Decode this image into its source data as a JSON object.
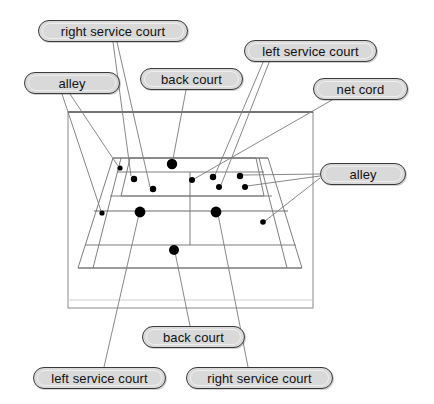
{
  "figure": {
    "type": "tennis-court-perspective-diagram",
    "background_color": "#ffffff",
    "line_color": "#6b6b6b",
    "point_color": "#000000",
    "label_fill": "#d9d9d9",
    "label_border": "#3a3a3a"
  },
  "labels": [
    {
      "id": "right-service-court-top",
      "text": "right service court",
      "x": 38,
      "y": 20,
      "width": 150
    },
    {
      "id": "left-service-court-top",
      "text": "left service court",
      "x": 244,
      "y": 40,
      "width": 133
    },
    {
      "id": "alley-left",
      "text": "alley",
      "x": 24,
      "y": 72,
      "width": 96
    },
    {
      "id": "back-court-top",
      "text": "back court",
      "x": 140,
      "y": 68,
      "width": 103
    },
    {
      "id": "net-cord",
      "text": "net cord",
      "x": 313,
      "y": 78,
      "width": 95
    },
    {
      "id": "alley-right",
      "text": "alley",
      "x": 320,
      "y": 163,
      "width": 86
    },
    {
      "id": "back-court-bottom",
      "text": "back court",
      "x": 142,
      "y": 326,
      "width": 103
    },
    {
      "id": "left-service-court-bottom",
      "text": "left service court",
      "x": 33,
      "y": 367,
      "width": 133
    },
    {
      "id": "right-service-court-bottom",
      "text": "right service court",
      "x": 186,
      "y": 367,
      "width": 147
    }
  ],
  "court": {
    "frame": {
      "x1": 68,
      "y1": 112,
      "x2": 313,
      "y2": 308
    },
    "far_baseline": {
      "x1": 113,
      "y1": 158,
      "x2": 268,
      "y2": 158
    },
    "near_baseline": {
      "x1": 78,
      "y1": 268,
      "x2": 302,
      "y2": 268
    },
    "net_line": {
      "x1": 94,
      "y1": 211,
      "x2": 288,
      "y2": 211
    },
    "far_service_line": {
      "x1": 107,
      "y1": 172,
      "x2": 275,
      "y2": 172
    },
    "near_service_line": {
      "x1": 100,
      "y1": 196,
      "x2": 282,
      "y2": 196
    },
    "center_service_line": {
      "x1": 190,
      "y1": 172,
      "x2": 190,
      "y2": 232
    }
  },
  "chart_data": {
    "type": "scatter",
    "xlabel": "",
    "ylabel": "",
    "point_color": "#000000",
    "points": [
      {
        "id": "p1",
        "x": 120,
        "y": 168,
        "r": 2.6,
        "region": "far alley"
      },
      {
        "id": "p2",
        "x": 134,
        "y": 179,
        "r": 3.2,
        "region": "far right service court"
      },
      {
        "id": "p3",
        "x": 153,
        "y": 189,
        "r": 3.2,
        "region": "far right service court"
      },
      {
        "id": "p4",
        "x": 172,
        "y": 164,
        "r": 5.2,
        "region": "far back court"
      },
      {
        "id": "p5",
        "x": 192,
        "y": 180,
        "r": 3.0,
        "region": "net cord"
      },
      {
        "id": "p6",
        "x": 213,
        "y": 177,
        "r": 3.2,
        "region": "far left service court"
      },
      {
        "id": "p7",
        "x": 219,
        "y": 187,
        "r": 3.0,
        "region": "far left service court"
      },
      {
        "id": "p8",
        "x": 240,
        "y": 176,
        "r": 3.2,
        "region": "far left alley"
      },
      {
        "id": "p9",
        "x": 245,
        "y": 187,
        "r": 3.0,
        "region": "far left alley"
      },
      {
        "id": "p10",
        "x": 102,
        "y": 213,
        "r": 2.6,
        "region": "near left alley"
      },
      {
        "id": "p11",
        "x": 140,
        "y": 212,
        "r": 5.4,
        "region": "near left service court"
      },
      {
        "id": "p12",
        "x": 216,
        "y": 212,
        "r": 5.4,
        "region": "near right service court"
      },
      {
        "id": "p13",
        "x": 263,
        "y": 222,
        "r": 2.8,
        "region": "near right alley"
      },
      {
        "id": "p14",
        "x": 174,
        "y": 250,
        "r": 5.0,
        "region": "near back court"
      }
    ]
  },
  "leaders": [
    {
      "from_label": "right-service-court-top",
      "points": "113,42 131,176"
    },
    {
      "from_label": "right-service-court-top",
      "points": "117,42 150,187"
    },
    {
      "from_label": "alley-left",
      "points": "70,94 118,166"
    },
    {
      "from_label": "alley-left",
      "points": "62,94 101,211"
    },
    {
      "from_label": "back-court-top",
      "points": "186,90 173,159"
    },
    {
      "from_label": "left-service-court-top",
      "points": "264,60 215,175"
    },
    {
      "from_label": "left-service-court-top",
      "points": "270,60 221,185"
    },
    {
      "from_label": "net-cord",
      "points": "332,100 194,179"
    },
    {
      "from_label": "alley-right",
      "points": "320,174 243,175"
    },
    {
      "from_label": "alley-right",
      "points": "320,176 247,186"
    },
    {
      "from_label": "alley-right",
      "points": "320,178 265,221"
    },
    {
      "from_label": "back-court-bottom",
      "points": "190,326 175,252"
    },
    {
      "from_label": "left-service-court-bottom",
      "points": "104,367 139,214"
    },
    {
      "from_label": "right-service-court-bottom",
      "points": "248,367 218,214"
    }
  ]
}
